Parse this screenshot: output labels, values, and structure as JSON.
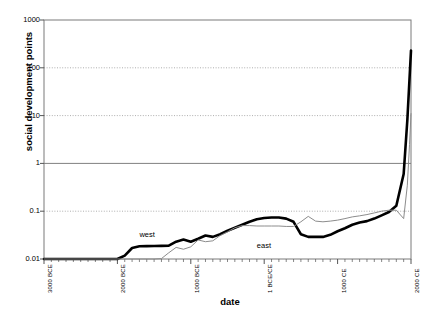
{
  "chart_data": {
    "type": "line",
    "title": "",
    "xlabel": "date",
    "ylabel": "social development points",
    "yscale": "log",
    "ylim": [
      0.01,
      1000
    ],
    "xlim": [
      -3000,
      2000
    ],
    "grid": true,
    "legend_position": "inline-annotations",
    "yticks": [
      "1000",
      "100",
      "10",
      "1",
      "0.1",
      "0.01"
    ],
    "ytick_values": [
      1000,
      100,
      10,
      1,
      0.1,
      0.01
    ],
    "xticks": [
      "3000 BCE",
      "2000 BCE",
      "1000 BCE",
      "1 BCE/CE",
      "1000 CE",
      "2000 CE"
    ],
    "xtick_values": [
      -3000,
      -2000,
      -1000,
      0,
      1000,
      2000
    ],
    "annotations": [
      {
        "text": "west",
        "x": -1700,
        "y": 0.032
      },
      {
        "text": "east",
        "x": -100,
        "y": 0.019
      }
    ],
    "series": [
      {
        "name": "west",
        "color": "#000000",
        "width": 2.6,
        "x": [
          -3000,
          -2800,
          -2600,
          -2400,
          -2200,
          -2000,
          -1900,
          -1800,
          -1700,
          -1600,
          -1500,
          -1400,
          -1300,
          -1200,
          -1100,
          -1000,
          -900,
          -800,
          -700,
          -600,
          -500,
          -400,
          -300,
          -200,
          -100,
          0,
          100,
          200,
          300,
          400,
          500,
          600,
          700,
          800,
          900,
          1000,
          1100,
          1200,
          1300,
          1400,
          1500,
          1600,
          1700,
          1800,
          1900,
          1950,
          2000
        ],
        "values": [
          0.01,
          0.01,
          0.01,
          0.01,
          0.01,
          0.01,
          0.0118,
          0.017,
          0.0185,
          0.0186,
          0.0187,
          0.0188,
          0.019,
          0.023,
          0.0255,
          0.023,
          0.0265,
          0.031,
          0.029,
          0.033,
          0.039,
          0.045,
          0.052,
          0.06,
          0.068,
          0.072,
          0.074,
          0.074,
          0.07,
          0.06,
          0.033,
          0.029,
          0.029,
          0.029,
          0.032,
          0.038,
          0.044,
          0.052,
          0.058,
          0.062,
          0.07,
          0.082,
          0.096,
          0.13,
          0.6,
          8.0,
          230.0
        ]
      },
      {
        "name": "east",
        "color": "#8c8c8c",
        "width": 1.0,
        "x": [
          -3000,
          -2000,
          -1500,
          -1400,
          -1300,
          -1200,
          -1100,
          -1000,
          -900,
          -800,
          -700,
          -600,
          -500,
          -400,
          -300,
          -200,
          -100,
          0,
          100,
          200,
          300,
          400,
          500,
          600,
          700,
          800,
          900,
          1000,
          1100,
          1200,
          1300,
          1400,
          1500,
          1600,
          1700,
          1800,
          1900,
          1950,
          1980,
          2000
        ],
        "values": [
          0.01,
          0.01,
          0.01,
          0.0102,
          0.0135,
          0.0175,
          0.016,
          0.018,
          0.025,
          0.023,
          0.024,
          0.031,
          0.037,
          0.045,
          0.05,
          0.05,
          0.049,
          0.049,
          0.049,
          0.049,
          0.048,
          0.048,
          0.06,
          0.078,
          0.062,
          0.06,
          0.062,
          0.065,
          0.07,
          0.076,
          0.08,
          0.085,
          0.092,
          0.1,
          0.105,
          0.105,
          0.07,
          0.35,
          2.5,
          11.0
        ]
      }
    ]
  }
}
